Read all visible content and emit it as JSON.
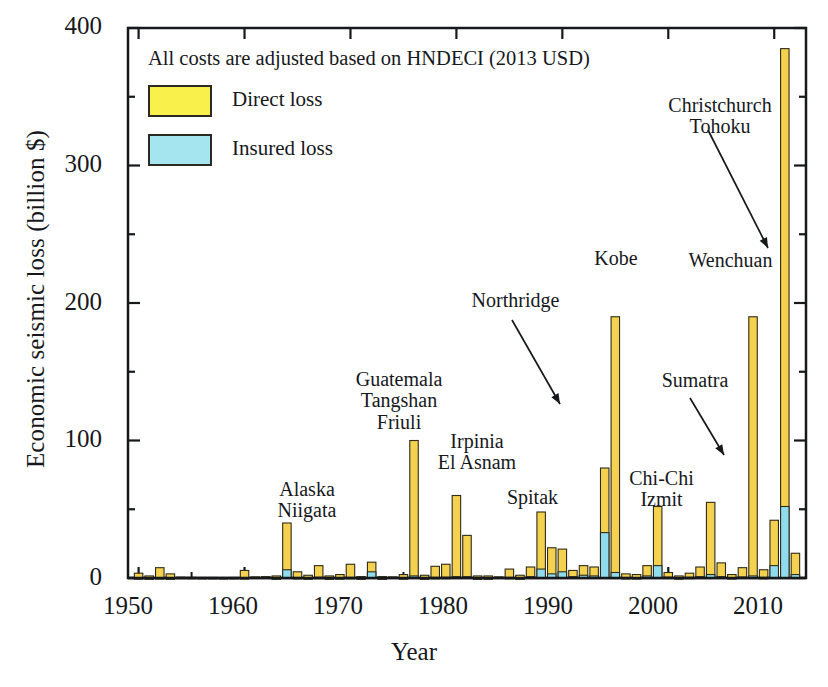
{
  "figure": {
    "note": "All costs are adjusted based on HNDECI (2013 USD)",
    "legend": [
      {
        "label": "Direct loss",
        "color": "#faf04b"
      },
      {
        "label": "Insured loss",
        "color": "#a5e5f0"
      }
    ],
    "annotations": [
      {
        "name": "alaska-niigata",
        "lines": [
          "Alaska",
          "Niigata"
        ],
        "arrow": false
      },
      {
        "name": "guatemala-tangshan-friuli",
        "lines": [
          "Guatemala",
          "Tangshan",
          "Friuli"
        ],
        "arrow": false
      },
      {
        "name": "irpinia-el-asnam",
        "lines": [
          "Irpinia",
          "El Asnam"
        ],
        "arrow": false
      },
      {
        "name": "spitak",
        "lines": [
          "Spitak"
        ],
        "arrow": false
      },
      {
        "name": "northridge",
        "lines": [
          "Northridge"
        ],
        "arrow": true
      },
      {
        "name": "kobe",
        "lines": [
          "Kobe"
        ],
        "arrow": false
      },
      {
        "name": "chi-chi-izmit",
        "lines": [
          "Chi-Chi",
          "Izmit"
        ],
        "arrow": false
      },
      {
        "name": "sumatra",
        "lines": [
          "Sumatra"
        ],
        "arrow": true
      },
      {
        "name": "wenchuan",
        "lines": [
          "Wenchuan"
        ],
        "arrow": false
      },
      {
        "name": "christchurch-tohoku",
        "lines": [
          "Christchurch",
          "Tohoku"
        ],
        "arrow": true
      }
    ]
  },
  "chart_data": {
    "type": "bar",
    "title": "",
    "xlabel": "Year",
    "ylabel": "Economic seismic loss (billion $)",
    "xlim": [
      1949,
      2013
    ],
    "ylim": [
      0,
      400
    ],
    "yticks": [
      0,
      100,
      200,
      300,
      400
    ],
    "yminor_step": 50,
    "xticks": [
      1950,
      1960,
      1970,
      1980,
      1990,
      2000,
      2010
    ],
    "grid": false,
    "legend_position": "upper-left",
    "stacked": true,
    "note": "All costs are adjusted based on HNDECI (2013 USD)",
    "series": [
      {
        "name": "Direct loss",
        "color": "#faf04b"
      },
      {
        "name": "Insured loss",
        "color": "#a5e5f0"
      }
    ],
    "x": [
      1950,
      1951,
      1952,
      1953,
      1954,
      1955,
      1956,
      1957,
      1958,
      1959,
      1960,
      1961,
      1962,
      1963,
      1964,
      1965,
      1966,
      1967,
      1968,
      1969,
      1970,
      1971,
      1972,
      1973,
      1974,
      1975,
      1976,
      1977,
      1978,
      1979,
      1980,
      1981,
      1982,
      1983,
      1984,
      1985,
      1986,
      1987,
      1988,
      1989,
      1990,
      1991,
      1992,
      1993,
      1994,
      1995,
      1996,
      1997,
      1998,
      1999,
      2000,
      2001,
      2002,
      2003,
      2004,
      2005,
      2006,
      2007,
      2008,
      2009,
      2010,
      2011,
      2012
    ],
    "direct_loss": [
      3.5,
      1.5,
      7.5,
      3.0,
      0.6,
      0.5,
      0.4,
      0.4,
      0.3,
      0.4,
      5.5,
      0.8,
      1.0,
      1.5,
      40.0,
      4.5,
      2.0,
      9.0,
      1.5,
      2.5,
      10.0,
      1.0,
      11.5,
      1.0,
      0.8,
      2.5,
      100.0,
      2.0,
      8.5,
      10.0,
      60.0,
      31.0,
      1.5,
      1.5,
      0.8,
      6.5,
      2.0,
      8.0,
      48.0,
      22.0,
      21.0,
      5.5,
      9.0,
      8.0,
      80.0,
      190.0,
      3.0,
      2.5,
      9.0,
      52.0,
      4.0,
      1.5,
      3.5,
      8.0,
      55.0,
      11.0,
      2.5,
      7.5,
      190.0,
      6.0,
      42.0,
      385.0,
      18.0
    ],
    "insured_loss": [
      0.2,
      0.1,
      0.3,
      0.1,
      0.0,
      0.0,
      0.0,
      0.0,
      0.0,
      0.0,
      0.3,
      0.0,
      0.0,
      0.1,
      6.0,
      0.4,
      0.1,
      0.6,
      0.1,
      0.2,
      0.5,
      0.1,
      4.5,
      0.1,
      0.0,
      0.2,
      1.5,
      0.1,
      0.5,
      0.6,
      1.0,
      1.0,
      0.1,
      0.1,
      0.0,
      0.5,
      0.1,
      1.0,
      6.5,
      3.0,
      4.5,
      1.0,
      2.0,
      1.5,
      33.0,
      4.0,
      0.4,
      0.3,
      1.5,
      9.0,
      0.7,
      0.2,
      0.6,
      1.0,
      2.5,
      1.0,
      0.3,
      0.8,
      1.5,
      0.5,
      9.0,
      52.0,
      2.5
    ]
  }
}
